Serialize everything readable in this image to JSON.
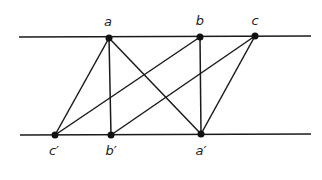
{
  "diagram": {
    "lines": {
      "top": {
        "x1": 19,
        "y1": 37,
        "x2": 311,
        "y2": 36
      },
      "bottom": {
        "x1": 20,
        "y1": 135,
        "x2": 311,
        "y2": 134
      }
    },
    "points": [
      {
        "id": "a",
        "label": "a",
        "x": 109,
        "y": 38,
        "label_x": 108,
        "label_y": 14
      },
      {
        "id": "b",
        "label": "b",
        "x": 200,
        "y": 37,
        "label_x": 200,
        "label_y": 13
      },
      {
        "id": "c",
        "label": "c",
        "x": 255,
        "y": 36,
        "label_x": 255,
        "label_y": 13
      },
      {
        "id": "c_prime",
        "label": "c′",
        "x": 55,
        "y": 135,
        "label_x": 54,
        "label_y": 143
      },
      {
        "id": "b_prime",
        "label": "b′",
        "x": 111,
        "y": 135,
        "label_x": 111,
        "label_y": 143
      },
      {
        "id": "a_prime",
        "label": "a′",
        "x": 201,
        "y": 134,
        "label_x": 201,
        "label_y": 143
      }
    ],
    "edges": [
      [
        "a",
        "c_prime"
      ],
      [
        "a",
        "b_prime"
      ],
      [
        "a",
        "a_prime"
      ],
      [
        "b",
        "c_prime"
      ],
      [
        "b",
        "a_prime"
      ],
      [
        "c",
        "b_prime"
      ],
      [
        "c",
        "a_prime"
      ]
    ],
    "stroke_color": "#1a1a1a"
  }
}
